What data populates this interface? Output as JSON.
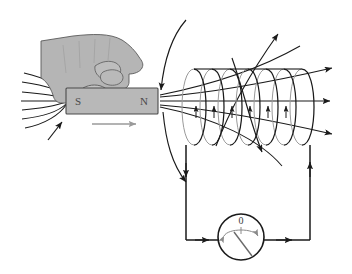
{
  "figure": {
    "background_color": "#ffffff"
  },
  "magnet": {
    "south_label": "S",
    "north_label": "N",
    "body_color": "#b8b8b8",
    "outline_color": "#4a4a4a",
    "label_color": "#4a4a4a",
    "motion_arrow": {
      "name": "magnet-motion-arrow",
      "direction": "right",
      "color": "#9a9a9a"
    }
  },
  "hand": {
    "name": "hand-holding-magnet",
    "fill_color": "#b5b5b5",
    "outline_color": "#5a5a5a"
  },
  "field_lines": {
    "name": "magnetic-field-lines",
    "color": "#1a1a1a",
    "left_converging_count": 5,
    "right_fanning_count": 5,
    "arc_over_count": 2,
    "arrow_count_right": 5
  },
  "coil": {
    "name": "solenoid-coil",
    "turns": 7,
    "stroke_color": "#1a1a1a",
    "back_stroke_color": "#9a9a9a",
    "axis_current_arrows": 6
  },
  "circuit": {
    "name": "circuit-loop",
    "wire_color": "#1a1a1a",
    "current_direction": "clockwise",
    "arrows": [
      {
        "name": "current-arrow-left-down",
        "direction": "down"
      },
      {
        "name": "current-arrow-bottom-right",
        "direction": "right"
      },
      {
        "name": "current-arrow-bottom-right-2",
        "direction": "right"
      },
      {
        "name": "current-arrow-right-up",
        "direction": "up"
      }
    ]
  },
  "galvanometer": {
    "name": "galvanometer",
    "zero_label": "0",
    "needle_deflection": "right",
    "body_color": "#ffffff",
    "outline_color": "#1a1a1a",
    "needle_color": "#6a6a6a",
    "scale_color": "#8a8a8a"
  }
}
